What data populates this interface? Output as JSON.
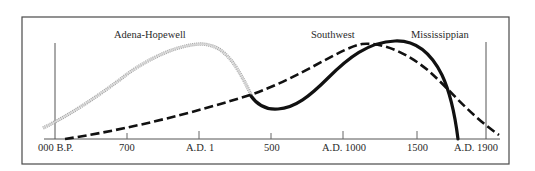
{
  "figure": {
    "frame": {
      "x": 22,
      "y": 17,
      "width": 487,
      "height": 147
    },
    "colors": {
      "frame": "#4a4a4a",
      "axis": "#555555",
      "text": "#2a2a2a",
      "adena_hopewell": "#a8a8a8",
      "southwest": "#111111",
      "mississippian": "#111111"
    }
  },
  "x_axis": {
    "ticks": [
      {
        "label": "000 B.P.",
        "x": 55
      },
      {
        "label": "700",
        "x": 127
      },
      {
        "label": "A.D. 1",
        "x": 199
      },
      {
        "label": "500",
        "x": 271
      },
      {
        "label": "A.D. 1000",
        "x": 343
      },
      {
        "label": "1500",
        "x": 417
      },
      {
        "label": "A.D. 1900",
        "x": 486
      }
    ]
  },
  "series": [
    {
      "name": "Adena-Hopewell",
      "style": "stippled",
      "peak_near": "A.D. 1"
    },
    {
      "name": "Southwest",
      "style": "dashed",
      "peak_near": "A.D. 1000–1500"
    },
    {
      "name": "Mississippian",
      "style": "solid-bold",
      "peak_near": "A.D. 1000–1500"
    }
  ],
  "labels": {
    "adena_hopewell": "Adena-Hopewell",
    "southwest": "Southwest",
    "mississippian": "Mississippian"
  },
  "ticks": {
    "t0": "000 B.P.",
    "t1": "700",
    "t2": "A.D. 1",
    "t3": "500",
    "t4": "A.D. 1000",
    "t5": "1500",
    "t6": "A.D. 1900"
  }
}
